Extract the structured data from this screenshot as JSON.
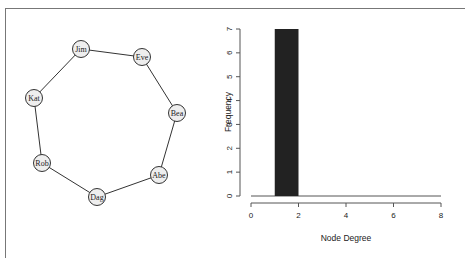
{
  "chart_data": [
    {
      "type": "network",
      "title": "",
      "nodes": [
        {
          "id": "Jim",
          "x": 81,
          "y": 49
        },
        {
          "id": "Eve",
          "x": 142,
          "y": 57
        },
        {
          "id": "Bea",
          "x": 177,
          "y": 113
        },
        {
          "id": "Abe",
          "x": 159,
          "y": 175
        },
        {
          "id": "Dag",
          "x": 97,
          "y": 197
        },
        {
          "id": "Rob",
          "x": 42,
          "y": 163
        },
        {
          "id": "Kat",
          "x": 34,
          "y": 98
        }
      ],
      "edges": [
        [
          "Jim",
          "Eve"
        ],
        [
          "Eve",
          "Bea"
        ],
        [
          "Bea",
          "Abe"
        ],
        [
          "Abe",
          "Dag"
        ],
        [
          "Dag",
          "Rob"
        ],
        [
          "Rob",
          "Kat"
        ],
        [
          "Kat",
          "Jim"
        ]
      ]
    },
    {
      "type": "bar",
      "title": "",
      "xlabel": "Node Degree",
      "ylabel": "Frequency",
      "bins": [
        {
          "from": 1,
          "to": 2,
          "count": 7
        }
      ],
      "categories": [
        "1-2"
      ],
      "values": [
        7
      ],
      "xlim": [
        0,
        8
      ],
      "ylim": [
        0,
        7
      ],
      "xticks": [
        "0",
        "2",
        "4",
        "6",
        "8"
      ],
      "yticks": [
        "0",
        "1",
        "2",
        "3",
        "4",
        "5",
        "6",
        "7"
      ],
      "grid": false,
      "bar_color": "#222222"
    }
  ]
}
